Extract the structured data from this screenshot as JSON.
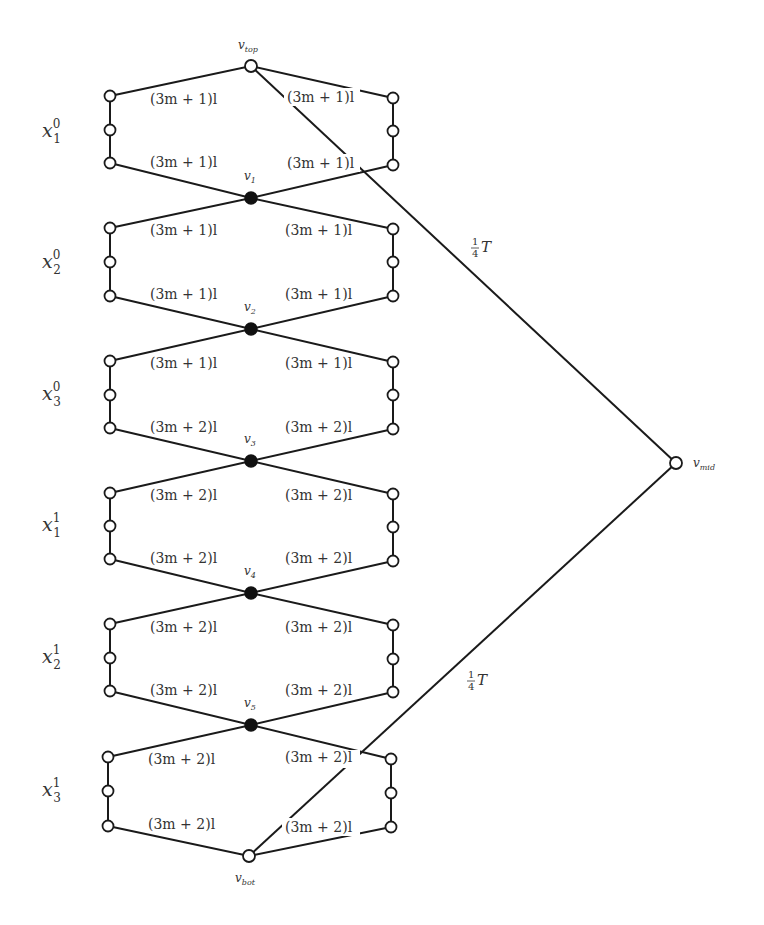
{
  "diagram": {
    "type": "graph-gadget-reduction",
    "vertices": {
      "v_top": {
        "label": "v",
        "sub": "top",
        "x": 251,
        "y": 66
      },
      "v1": {
        "label": "v",
        "sub": "1",
        "x": 251,
        "y": 198
      },
      "v2": {
        "label": "v",
        "sub": "2",
        "x": 251,
        "y": 329
      },
      "v3": {
        "label": "v",
        "sub": "3",
        "x": 251,
        "y": 461
      },
      "v4": {
        "label": "v",
        "sub": "4",
        "x": 251,
        "y": 593
      },
      "v5": {
        "label": "v",
        "sub": "5",
        "x": 251,
        "y": 725
      },
      "v_bot": {
        "label": "v",
        "sub": "bot",
        "x": 249,
        "y": 856
      },
      "v_mid": {
        "label": "v",
        "sub": "mid",
        "x": 676,
        "y": 463
      }
    },
    "gadgets": [
      {
        "name": "x",
        "sup": "0",
        "sub": "1",
        "top_weight_left": "(3m + 1)l",
        "top_weight_right": "(3m + 1)l",
        "bottom_weight_left": "(3m + 1)l",
        "bottom_weight_right": "(3m + 1)l"
      },
      {
        "name": "x",
        "sup": "0",
        "sub": "2",
        "top_weight_left": "(3m + 1)l",
        "top_weight_right": "(3m + 1)l",
        "bottom_weight_left": "(3m + 1)l",
        "bottom_weight_right": "(3m + 1)l"
      },
      {
        "name": "x",
        "sup": "0",
        "sub": "3",
        "top_weight_left": "(3m + 1)l",
        "top_weight_right": "(3m + 1)l",
        "bottom_weight_left": "(3m + 2)l",
        "bottom_weight_right": "(3m + 2)l"
      },
      {
        "name": "x",
        "sup": "1",
        "sub": "1",
        "top_weight_left": "(3m + 2)l",
        "top_weight_right": "(3m + 2)l",
        "bottom_weight_left": "(3m + 2)l",
        "bottom_weight_right": "(3m + 2)l"
      },
      {
        "name": "x",
        "sup": "1",
        "sub": "2",
        "top_weight_left": "(3m + 2)l",
        "top_weight_right": "(3m + 2)l",
        "bottom_weight_left": "(3m + 2)l",
        "bottom_weight_right": "(3m + 2)l"
      },
      {
        "name": "x",
        "sup": "1",
        "sub": "3",
        "top_weight_left": "(3m + 2)l",
        "top_weight_right": "(3m + 2)l",
        "bottom_weight_left": "(3m + 2)l",
        "bottom_weight_right": "(3m + 2)l"
      }
    ],
    "long_edges": [
      {
        "from": "v_top",
        "to": "v_mid",
        "weight_num": "1",
        "weight_den": "4",
        "weight_var": "T"
      },
      {
        "from": "v_bot",
        "to": "v_mid",
        "weight_num": "1",
        "weight_den": "4",
        "weight_var": "T"
      }
    ]
  }
}
